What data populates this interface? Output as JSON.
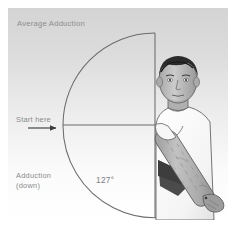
{
  "figure": {
    "title": "Average Adduction",
    "start_label": "Start here",
    "motion_label": "Adduction",
    "motion_direction_label": "(down)",
    "angle_value": "127°",
    "angle_degrees": 127,
    "icons": {
      "start_arrow": "arrow-right-icon",
      "motion_arrow": "arc-arrow-icon"
    },
    "colors": {
      "background_top": "#d8d8d8",
      "background_bottom": "#ffffff",
      "line": "#595959",
      "text": "#8a8a8a",
      "skin": "#b9b9b9",
      "hair": "#2a2a2a",
      "shirt": "#fdfdfd",
      "shadow": "#4a4a4a"
    },
    "geometry": {
      "center_x": 155,
      "center_y": 125,
      "radius": 92,
      "start_angle_deg": 180,
      "end_angle_deg": 53
    }
  }
}
